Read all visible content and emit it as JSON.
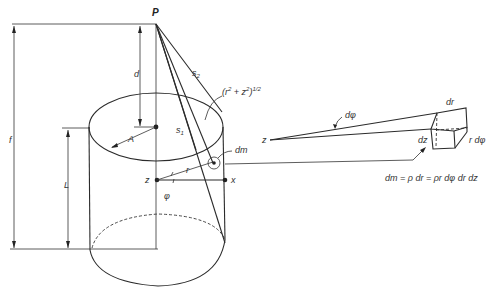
{
  "figure": {
    "labels": {
      "point": "P",
      "distance_d": "d",
      "distance_f": "f",
      "length_L": "L",
      "radius_A": "A",
      "s1": "s",
      "s1_sub": "1",
      "s2": "s",
      "s2_sub": "2",
      "hyp_expr": "(r",
      "hyp_sup1": "2",
      "hyp_plus": " + z",
      "hyp_sup2": "2",
      "hyp_close": ")",
      "hyp_exp": "1/2",
      "dm": "dm",
      "z_axis": "z",
      "x_axis": "x",
      "r": "r",
      "phi": "φ",
      "zoom_z": "z",
      "dphi": "dφ",
      "dr": "dr",
      "dz": "dz",
      "rdphi": "r dφ",
      "equation": "dm = ρ dr = ρr dφ dr dz"
    }
  }
}
